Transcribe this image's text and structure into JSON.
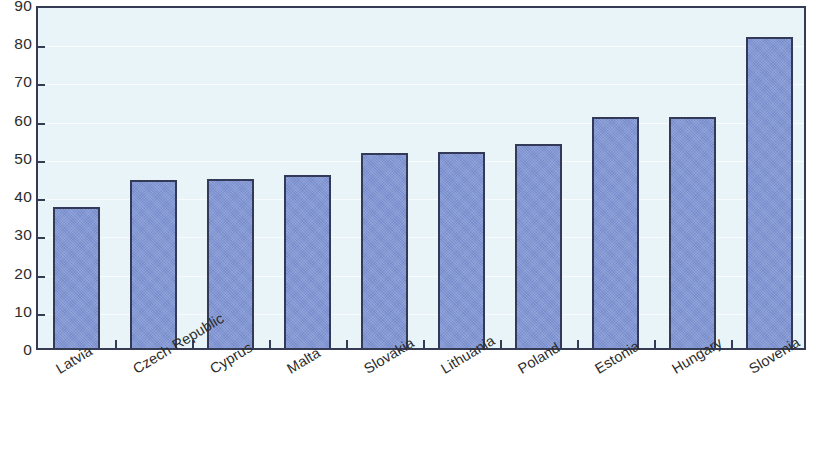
{
  "chart_data": {
    "type": "bar",
    "title": "",
    "subtitle": "",
    "xlabel": "",
    "ylabel": "",
    "categories": [
      "Latvia",
      "Czech Republic",
      "Cyprus",
      "Malta",
      "Slovakia",
      "Lithuania",
      "Poland",
      "Estonia",
      "Hungary",
      "Slovenia"
    ],
    "values": [
      37.0,
      44.0,
      44.1,
      45.2,
      51.0,
      51.3,
      53.3,
      60.5,
      60.5,
      81.5
    ],
    "ylim": [
      0,
      90
    ],
    "ytick_labels": [
      "0",
      "10",
      "20",
      "30",
      "40",
      "50",
      "60",
      "70",
      "80",
      "90"
    ],
    "ytick_values": [
      0,
      10,
      20,
      30,
      40,
      50,
      60,
      70,
      80,
      90
    ],
    "grid": true,
    "grid_axis": "y",
    "legend": false,
    "legend_position": "none",
    "annotations": [],
    "series": [
      {
        "name": "",
        "values": [
          37.0,
          44.0,
          44.1,
          45.2,
          51.0,
          51.3,
          53.3,
          60.5,
          60.5,
          81.5
        ]
      }
    ]
  },
  "style": {
    "bar_fill": "#8196d4",
    "bar_border": "#333a57",
    "plot_background": "#e8f4f8",
    "frame_color": "#353b52",
    "page_background": "#ffffff",
    "text_color": "#2c2c2c"
  }
}
